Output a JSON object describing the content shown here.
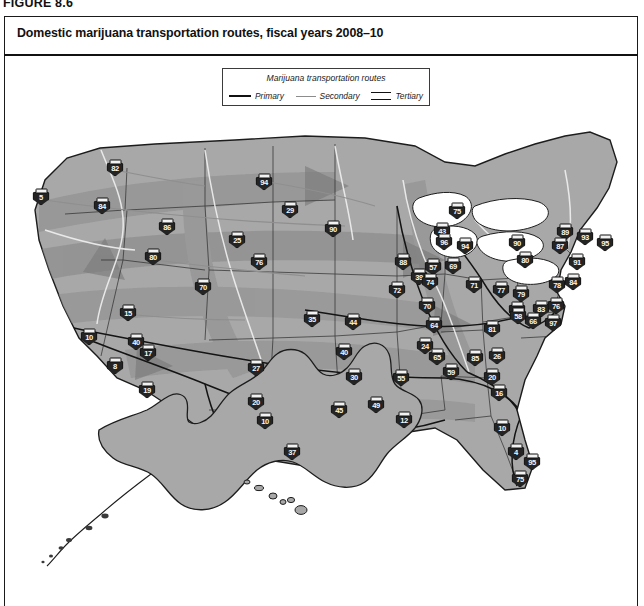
{
  "figure": {
    "label": "FIGURE 8.6",
    "title": "Domestic marijuana transportation routes, fiscal years 2008–10"
  },
  "legend": {
    "title": "Marijuana transportation routes",
    "items": [
      {
        "label": "Primary",
        "swatch": "solid-black-line"
      },
      {
        "label": "Secondary",
        "swatch": "solid-gray-line"
      },
      {
        "label": "Tertiary",
        "swatch": "double-line"
      }
    ]
  },
  "colors": {
    "land": "#a8a8a8",
    "land_light": "#b8b8b8",
    "corridor": "#8e8e8e",
    "corridor_dark": "#7d7d7d",
    "outline": "#1d1d1d",
    "river": "#f2f2f2",
    "shield_fill": "#242424",
    "shield_text": "#f6f6f6",
    "page": "#ffffff"
  },
  "map": {
    "insets": [
      "Alaska",
      "Hawaii"
    ],
    "shields": [
      {
        "id": "5",
        "x": 36,
        "y": 87
      },
      {
        "id": "82",
        "x": 110,
        "y": 58
      },
      {
        "id": "84",
        "x": 97,
        "y": 96
      },
      {
        "id": "86",
        "x": 162,
        "y": 117
      },
      {
        "id": "80",
        "x": 148,
        "y": 147
      },
      {
        "id": "25",
        "x": 232,
        "y": 130
      },
      {
        "id": "70",
        "x": 198,
        "y": 177
      },
      {
        "id": "76",
        "x": 254,
        "y": 152
      },
      {
        "id": "15",
        "x": 123,
        "y": 203
      },
      {
        "id": "40",
        "x": 131,
        "y": 232
      },
      {
        "id": "10",
        "x": 84,
        "y": 227
      },
      {
        "id": "8",
        "x": 110,
        "y": 256
      },
      {
        "id": "17",
        "x": 143,
        "y": 243
      },
      {
        "id": "19",
        "x": 142,
        "y": 280
      },
      {
        "id": "27",
        "x": 251,
        "y": 258
      },
      {
        "id": "20",
        "x": 251,
        "y": 292
      },
      {
        "id": "10",
        "x": 260,
        "y": 311
      },
      {
        "id": "37",
        "x": 287,
        "y": 342
      },
      {
        "id": "94",
        "x": 259,
        "y": 72
      },
      {
        "id": "29",
        "x": 285,
        "y": 100
      },
      {
        "id": "90",
        "x": 328,
        "y": 119
      },
      {
        "id": "35",
        "x": 307,
        "y": 209
      },
      {
        "id": "44",
        "x": 348,
        "y": 212
      },
      {
        "id": "40",
        "x": 339,
        "y": 242
      },
      {
        "id": "30",
        "x": 349,
        "y": 267
      },
      {
        "id": "45",
        "x": 334,
        "y": 300
      },
      {
        "id": "49",
        "x": 371,
        "y": 295
      },
      {
        "id": "55",
        "x": 396,
        "y": 268
      },
      {
        "id": "12",
        "x": 399,
        "y": 310
      },
      {
        "id": "43",
        "x": 437,
        "y": 121
      },
      {
        "id": "88",
        "x": 398,
        "y": 152
      },
      {
        "id": "39",
        "x": 414,
        "y": 167
      },
      {
        "id": "57",
        "x": 428,
        "y": 157
      },
      {
        "id": "72",
        "x": 392,
        "y": 180
      },
      {
        "id": "74",
        "x": 425,
        "y": 172
      },
      {
        "id": "70",
        "x": 422,
        "y": 196
      },
      {
        "id": "64",
        "x": 429,
        "y": 215
      },
      {
        "id": "24",
        "x": 420,
        "y": 236
      },
      {
        "id": "65",
        "x": 432,
        "y": 247
      },
      {
        "id": "59",
        "x": 446,
        "y": 262
      },
      {
        "id": "75",
        "x": 452,
        "y": 101
      },
      {
        "id": "96",
        "x": 439,
        "y": 132
      },
      {
        "id": "94",
        "x": 460,
        "y": 136
      },
      {
        "id": "69",
        "x": 448,
        "y": 156
      },
      {
        "id": "71",
        "x": 469,
        "y": 175
      },
      {
        "id": "81",
        "x": 487,
        "y": 219
      },
      {
        "id": "90",
        "x": 512,
        "y": 133
      },
      {
        "id": "80",
        "x": 520,
        "y": 150
      },
      {
        "id": "77",
        "x": 496,
        "y": 180
      },
      {
        "id": "79",
        "x": 516,
        "y": 184
      },
      {
        "id": "68",
        "x": 512,
        "y": 200
      },
      {
        "id": "83",
        "x": 536,
        "y": 199
      },
      {
        "id": "66",
        "x": 528,
        "y": 211
      },
      {
        "id": "76",
        "x": 551,
        "y": 196
      },
      {
        "id": "97",
        "x": 548,
        "y": 213
      },
      {
        "id": "78",
        "x": 552,
        "y": 175
      },
      {
        "id": "58",
        "x": 513,
        "y": 206
      },
      {
        "id": "85",
        "x": 470,
        "y": 248
      },
      {
        "id": "26",
        "x": 492,
        "y": 246
      },
      {
        "id": "20",
        "x": 487,
        "y": 267
      },
      {
        "id": "16",
        "x": 494,
        "y": 283
      },
      {
        "id": "10",
        "x": 497,
        "y": 318
      },
      {
        "id": "4",
        "x": 511,
        "y": 342
      },
      {
        "id": "95",
        "x": 527,
        "y": 352
      },
      {
        "id": "75",
        "x": 515,
        "y": 369
      },
      {
        "id": "89",
        "x": 560,
        "y": 122
      },
      {
        "id": "87",
        "x": 555,
        "y": 136
      },
      {
        "id": "93",
        "x": 580,
        "y": 127
      },
      {
        "id": "95",
        "x": 600,
        "y": 133
      },
      {
        "id": "91",
        "x": 572,
        "y": 152
      },
      {
        "id": "84",
        "x": 568,
        "y": 172
      }
    ]
  }
}
